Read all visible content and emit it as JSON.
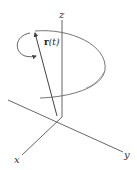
{
  "figure": {
    "labels": {
      "z_axis": "z",
      "y_axis": "y",
      "x_axis": "x",
      "vector_bold": "r",
      "vector_arg": "(t)"
    },
    "colors": {
      "background": "#ffffff",
      "stroke": "#555555",
      "text": "#333333"
    }
  }
}
